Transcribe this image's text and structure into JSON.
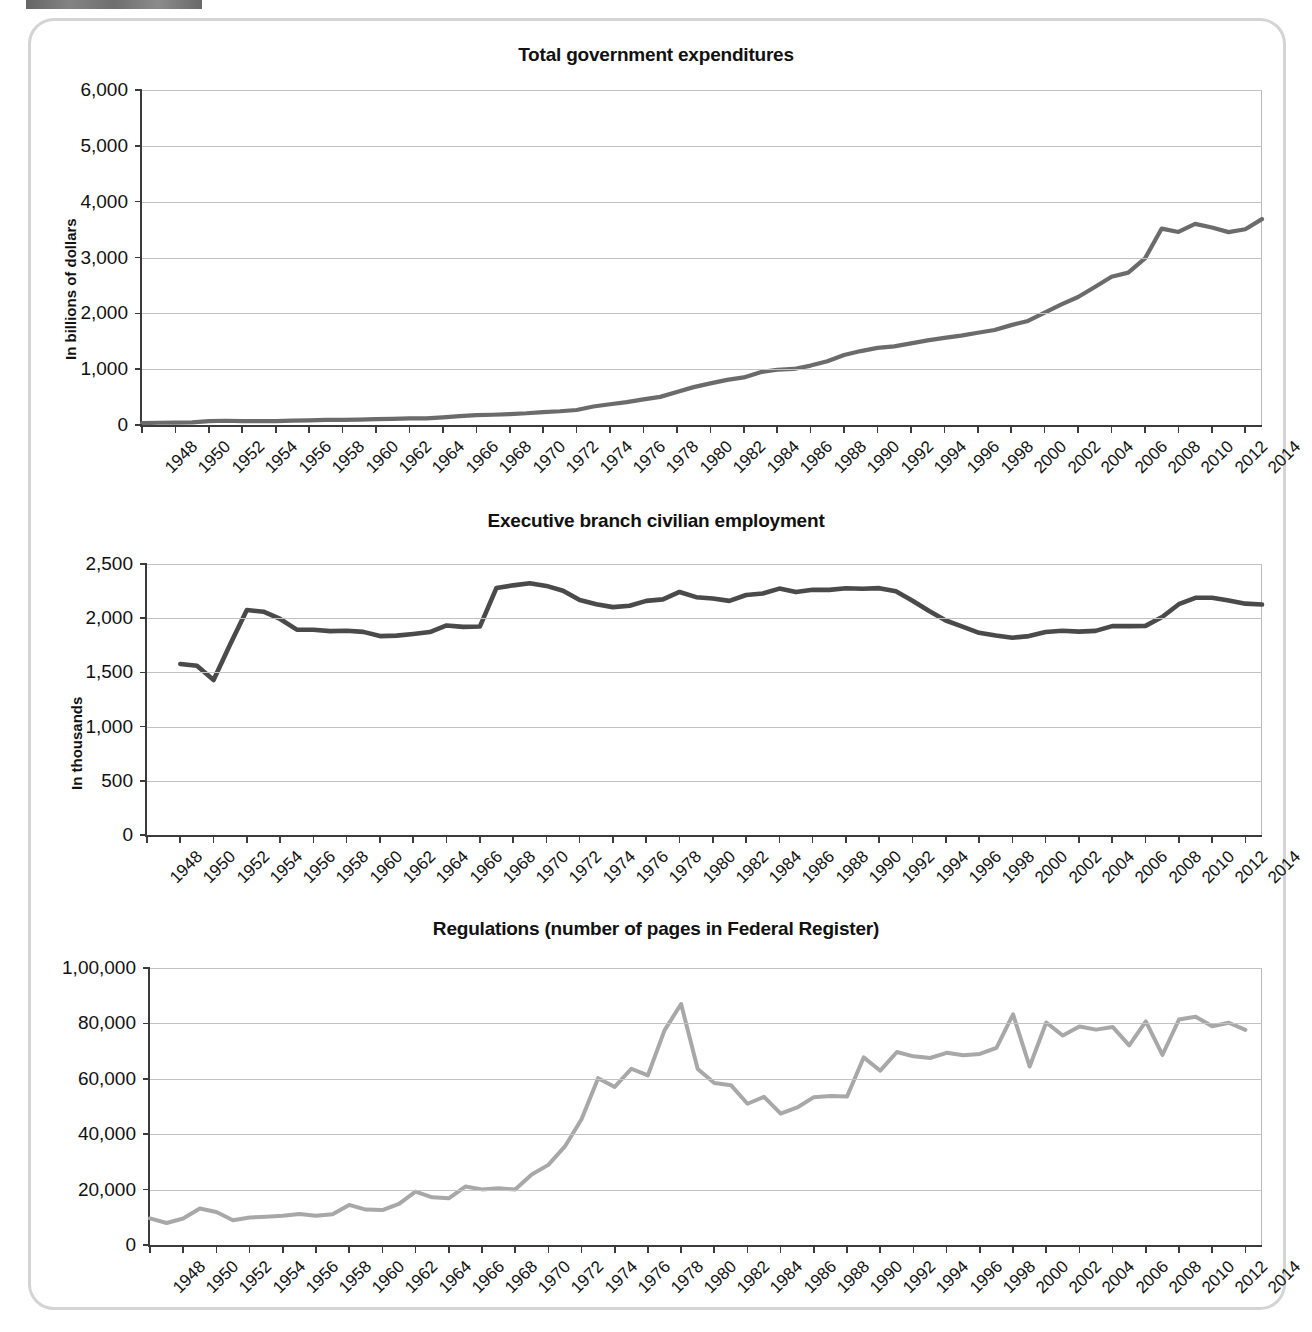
{
  "page": {
    "background_color": "#ffffff",
    "frame_color": "#d4d4d4"
  },
  "charts": [
    {
      "id": "total-government-expenditures",
      "title": "Total government expenditures",
      "ylabel": "In billions of dollars",
      "line_color": "#6b6b6b",
      "ytick_labels": [
        "6,000",
        "5,000",
        "4,000",
        "3,000",
        "2,000",
        "1,000",
        "0"
      ],
      "xtick_labels": [
        "1948",
        "1950",
        "1952",
        "1954",
        "1956",
        "1958",
        "1960",
        "1962",
        "1964",
        "1966",
        "1968",
        "1970",
        "1972",
        "1974",
        "1976",
        "1978",
        "1980",
        "1982",
        "1984",
        "1986",
        "1988",
        "1990",
        "1992",
        "1994",
        "1996",
        "1998",
        "2000",
        "2002",
        "2004",
        "2006",
        "2008",
        "2010",
        "2012",
        "2014"
      ]
    },
    {
      "id": "executive-branch-civilian-employment",
      "title": "Executive branch civilian employment",
      "ylabel": "In thousands",
      "line_color": "#4a4a4a",
      "ytick_labels": [
        "2,500",
        "2,000",
        "1,500",
        "1,000",
        "500",
        "0"
      ],
      "xtick_labels": [
        "1948",
        "1950",
        "1952",
        "1954",
        "1956",
        "1958",
        "1960",
        "1962",
        "1964",
        "1966",
        "1968",
        "1970",
        "1972",
        "1974",
        "1976",
        "1978",
        "1980",
        "1982",
        "1984",
        "1986",
        "1988",
        "1990",
        "1992",
        "1994",
        "1996",
        "1998",
        "2000",
        "2002",
        "2004",
        "2006",
        "2008",
        "2010",
        "2012",
        "2014"
      ]
    },
    {
      "id": "regulations-federal-register-pages",
      "title": "Regulations (number of pages in Federal Register)",
      "ylabel": "",
      "line_color": "#a8a8a8",
      "ytick_labels": [
        "1,00,000",
        "80,000",
        "60,000",
        "40,000",
        "20,000",
        "0"
      ],
      "xtick_labels": [
        "1948",
        "1950",
        "1952",
        "1954",
        "1956",
        "1958",
        "1960",
        "1962",
        "1964",
        "1966",
        "1968",
        "1970",
        "1972",
        "1974",
        "1976",
        "1978",
        "1980",
        "1982",
        "1984",
        "1986",
        "1988",
        "1990",
        "1992",
        "1994",
        "1996",
        "1998",
        "2000",
        "2002",
        "2004",
        "2006",
        "2008",
        "2010",
        "2012",
        "2014"
      ]
    }
  ],
  "chart_data": [
    {
      "type": "line",
      "title": "Total government expenditures",
      "xlabel": "",
      "ylabel": "In billions of dollars",
      "ylim": [
        0,
        6000
      ],
      "ytick_step": 1000,
      "xlim": [
        1948,
        2015
      ],
      "grid": true,
      "legend": "none",
      "x": [
        1948,
        1949,
        1950,
        1951,
        1952,
        1953,
        1954,
        1955,
        1956,
        1957,
        1958,
        1959,
        1960,
        1961,
        1962,
        1963,
        1964,
        1965,
        1966,
        1967,
        1968,
        1969,
        1970,
        1971,
        1972,
        1973,
        1974,
        1975,
        1976,
        1977,
        1978,
        1979,
        1980,
        1981,
        1982,
        1983,
        1984,
        1985,
        1986,
        1987,
        1988,
        1989,
        1990,
        1991,
        1992,
        1993,
        1994,
        1995,
        1996,
        1997,
        1998,
        1999,
        2000,
        2001,
        2002,
        2003,
        2004,
        2005,
        2006,
        2007,
        2008,
        2009,
        2010,
        2011,
        2012,
        2013,
        2014,
        2015
      ],
      "values": [
        33,
        40,
        43,
        46,
        68,
        76,
        71,
        68,
        71,
        77,
        83,
        92,
        92,
        98,
        107,
        111,
        119,
        118,
        135,
        158,
        178,
        184,
        196,
        210,
        231,
        246,
        269,
        332,
        372,
        409,
        459,
        504,
        591,
        678,
        746,
        808,
        852,
        946,
        990,
        1004,
        1064,
        1143,
        1253,
        1324,
        1382,
        1409,
        1462,
        1516,
        1561,
        1601,
        1653,
        1702,
        1789,
        1863,
        2011,
        2160,
        2293,
        2472,
        2655,
        2729,
        2983,
        3518,
        3457,
        3603,
        3537,
        3455,
        3506,
        3688
      ]
    },
    {
      "type": "line",
      "title": "Executive branch civilian employment",
      "xlabel": "",
      "ylabel": "In thousands",
      "ylim": [
        0,
        2500
      ],
      "ytick_step": 500,
      "xlim": [
        1948,
        2015
      ],
      "grid": true,
      "legend": "none",
      "x": [
        1950,
        1951,
        1952,
        1953,
        1954,
        1955,
        1956,
        1957,
        1958,
        1959,
        1960,
        1961,
        1962,
        1963,
        1964,
        1965,
        1966,
        1967,
        1968,
        1969,
        1970,
        1971,
        1972,
        1973,
        1974,
        1975,
        1976,
        1977,
        1978,
        1979,
        1980,
        1981,
        1982,
        1983,
        1984,
        1985,
        1986,
        1987,
        1988,
        1989,
        1990,
        1991,
        1992,
        1993,
        1994,
        1995,
        1996,
        1997,
        1998,
        1999,
        2000,
        2001,
        2002,
        2003,
        2004,
        2005,
        2006,
        2007,
        2008,
        2009,
        2010,
        2011,
        2012,
        2013,
        2014,
        2015
      ],
      "values": [
        1578,
        1561,
        1430,
        1760,
        2075,
        2060,
        1993,
        1895,
        1894,
        1881,
        1884,
        1874,
        1835,
        1839,
        1855,
        1872,
        1933,
        1920,
        1923,
        2279,
        2303,
        2322,
        2298,
        2254,
        2167,
        2128,
        2102,
        2115,
        2160,
        2174,
        2242,
        2194,
        2182,
        2160,
        2214,
        2228,
        2273,
        2241,
        2262,
        2261,
        2276,
        2271,
        2277,
        2248,
        2161,
        2066,
        1979,
        1922,
        1865,
        1840,
        1820,
        1835,
        1872,
        1884,
        1876,
        1883,
        1927,
        1927,
        1929,
        2011,
        2129,
        2188,
        2189,
        2164,
        2134,
        2126
      ]
    },
    {
      "type": "line",
      "title": "Regulations (number of pages in Federal Register)",
      "xlabel": "",
      "ylabel": "",
      "ylim": [
        0,
        100000
      ],
      "ytick_step": 20000,
      "xlim": [
        1948,
        2015
      ],
      "grid": true,
      "legend": "none",
      "x": [
        1948,
        1949,
        1950,
        1951,
        1952,
        1953,
        1954,
        1955,
        1956,
        1957,
        1958,
        1959,
        1960,
        1961,
        1962,
        1963,
        1964,
        1965,
        1966,
        1967,
        1968,
        1969,
        1970,
        1971,
        1972,
        1973,
        1974,
        1975,
        1976,
        1977,
        1978,
        1979,
        1980,
        1981,
        1982,
        1983,
        1984,
        1985,
        1986,
        1987,
        1988,
        1989,
        1990,
        1991,
        1992,
        1993,
        1994,
        1995,
        1996,
        1997,
        1998,
        1999,
        2000,
        2001,
        2002,
        2003,
        2004,
        2005,
        2006,
        2007,
        2008,
        2009,
        2010,
        2011,
        2012,
        2013,
        2014
      ],
      "values": [
        9608,
        7952,
        9562,
        13175,
        11896,
        8912,
        9910,
        10196,
        10528,
        11156,
        10579,
        11116,
        14479,
        12792,
        12612,
        14842,
        19304,
        17206,
        16850,
        21088,
        20072,
        20466,
        20036,
        25447,
        28924,
        35586,
        45422,
        60221,
        57072,
        63629,
        61261,
        77498,
        87012,
        63554,
        58494,
        57704,
        50997,
        53480,
        47418,
        49654,
        53376,
        53821,
        53618,
        67715,
        62928,
        69688,
        68108,
        67518,
        69368,
        68530,
        68985,
        71161,
        83293,
        64438,
        80332,
        75606,
        78851,
        77752,
        78724,
        72090,
        80700,
        68598,
        81405,
        82415,
        78961,
        80224,
        77687
      ]
    }
  ]
}
